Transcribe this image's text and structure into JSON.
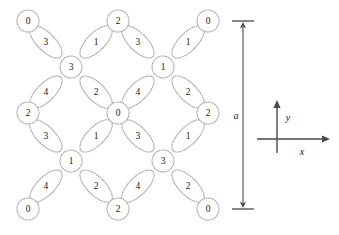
{
  "figure": {
    "type": "crystal-lattice-diagram",
    "background": "#ffffff",
    "outline_color": "#a8a8a8",
    "text_color": "#1a1a1a",
    "axis_color": "#4a4a4a"
  },
  "lattice": {
    "node_radius": 11,
    "cell_pitch_x": 90,
    "cell_pitch_y": 92,
    "nodes": [
      {
        "id": "node-r0c0",
        "label": "0",
        "x": 28,
        "y": 21
      },
      {
        "id": "node-r0c1",
        "label": "2",
        "x": 118,
        "y": 21
      },
      {
        "id": "node-r0c2",
        "label": "0",
        "x": 208,
        "y": 21
      },
      {
        "id": "node-r1c0",
        "label": "2",
        "x": 28,
        "y": 113
      },
      {
        "id": "node-r1c1",
        "label": "0",
        "x": 118,
        "y": 113
      },
      {
        "id": "node-r1c2",
        "label": "2",
        "x": 208,
        "y": 113
      },
      {
        "id": "node-r2c0",
        "label": "0",
        "x": 28,
        "y": 209
      },
      {
        "id": "node-r2c1",
        "label": "2",
        "x": 118,
        "y": 209
      },
      {
        "id": "node-r2c2",
        "label": "0",
        "x": 208,
        "y": 209
      }
    ],
    "hubs": [
      {
        "id": "hub-upper-left",
        "label": "3",
        "x": 71,
        "y": 67
      },
      {
        "id": "hub-upper-right",
        "label": "1",
        "x": 163,
        "y": 67
      },
      {
        "id": "hub-lower-left",
        "label": "1",
        "x": 71,
        "y": 161
      },
      {
        "id": "hub-lower-right",
        "label": "3",
        "x": 163,
        "y": 161
      }
    ],
    "bond_rx": 9,
    "bond_ry": 21,
    "bond_offset": 25,
    "bonds": [
      {
        "hub": "hub-upper-left",
        "dir": "nw",
        "label": "3"
      },
      {
        "hub": "hub-upper-left",
        "dir": "ne",
        "label": "1"
      },
      {
        "hub": "hub-upper-left",
        "dir": "sw",
        "label": "4"
      },
      {
        "hub": "hub-upper-left",
        "dir": "se",
        "label": "2"
      },
      {
        "hub": "hub-upper-right",
        "dir": "nw",
        "label": "3"
      },
      {
        "hub": "hub-upper-right",
        "dir": "ne",
        "label": "1"
      },
      {
        "hub": "hub-upper-right",
        "dir": "sw",
        "label": "4"
      },
      {
        "hub": "hub-upper-right",
        "dir": "se",
        "label": "2"
      },
      {
        "hub": "hub-lower-left",
        "dir": "nw",
        "label": "3"
      },
      {
        "hub": "hub-lower-left",
        "dir": "ne",
        "label": "1"
      },
      {
        "hub": "hub-lower-left",
        "dir": "sw",
        "label": "4"
      },
      {
        "hub": "hub-lower-left",
        "dir": "se",
        "label": "2"
      },
      {
        "hub": "hub-lower-right",
        "dir": "nw",
        "label": "3"
      },
      {
        "hub": "hub-lower-right",
        "dir": "ne",
        "label": "1"
      },
      {
        "hub": "hub-lower-right",
        "dir": "sw",
        "label": "4"
      },
      {
        "hub": "hub-lower-right",
        "dir": "se",
        "label": "2"
      }
    ]
  },
  "dimension": {
    "label": "a",
    "x": 243,
    "y_top": 21,
    "y_bottom": 209,
    "tick_half_width": 11,
    "label_x": 236,
    "label_y": 115
  },
  "axes": {
    "origin_x": 277,
    "origin_y": 139,
    "x_label": "x",
    "y_label": "y",
    "x_end": 330,
    "y_end": 100,
    "x_label_pos": {
      "x": 302,
      "y": 151
    },
    "y_label_pos": {
      "x": 288,
      "y": 117
    }
  }
}
